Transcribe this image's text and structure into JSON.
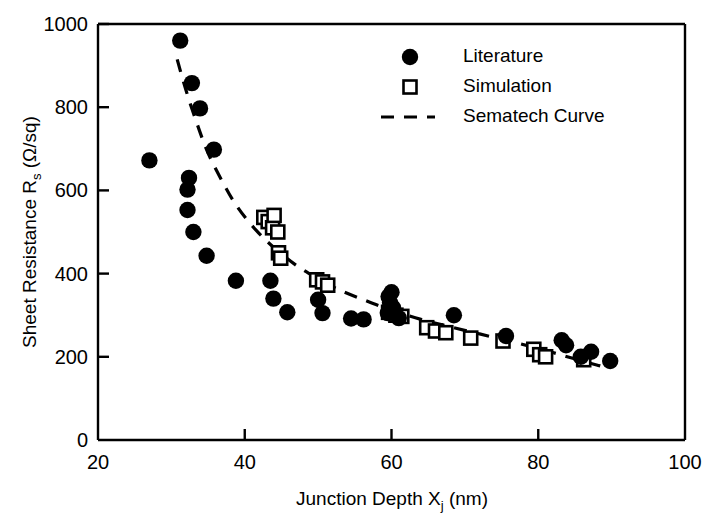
{
  "chart_data": {
    "type": "scatter",
    "title": "",
    "xlabel": "Junction Depth Xj (nm)",
    "xlabel_main": "Junction Depth X",
    "xlabel_sub": "j",
    "xlabel_unit": " (nm)",
    "ylabel": "Sheet Resistance Rs (Ω/sq)",
    "ylabel_main": "Sheet Resistance R",
    "ylabel_sub": "s",
    "ylabel_unit": " (Ω/sq)",
    "xlim": [
      20,
      100
    ],
    "ylim": [
      0,
      1000
    ],
    "xticks": [
      "20",
      "40",
      "60",
      "80",
      "100"
    ],
    "xtick_values": [
      20,
      40,
      60,
      80,
      100
    ],
    "yticks": [
      "0",
      "200",
      "400",
      "600",
      "800",
      "1000"
    ],
    "ytick_values": [
      0,
      200,
      400,
      600,
      800,
      1000
    ],
    "grid": false,
    "legend_position": "top-right-inside",
    "series": [
      {
        "name": "Literature",
        "marker": "filled-circle",
        "color": "#000000",
        "points": [
          [
            27.0,
            672
          ],
          [
            31.2,
            960
          ],
          [
            32.8,
            858
          ],
          [
            33.9,
            797
          ],
          [
            35.8,
            698
          ],
          [
            32.4,
            630
          ],
          [
            32.2,
            602
          ],
          [
            32.2,
            553
          ],
          [
            33.0,
            500
          ],
          [
            34.8,
            443
          ],
          [
            38.8,
            383
          ],
          [
            43.5,
            383
          ],
          [
            43.9,
            340
          ],
          [
            45.8,
            307
          ],
          [
            50.0,
            337
          ],
          [
            50.6,
            305
          ],
          [
            54.5,
            292
          ],
          [
            56.2,
            290
          ],
          [
            59.5,
            305
          ],
          [
            59.6,
            345
          ],
          [
            60.0,
            355
          ],
          [
            60.2,
            318
          ],
          [
            59.8,
            330
          ],
          [
            68.5,
            300
          ],
          [
            75.6,
            250
          ],
          [
            83.2,
            240
          ],
          [
            83.8,
            228
          ],
          [
            85.8,
            200
          ],
          [
            87.2,
            212
          ],
          [
            89.8,
            190
          ],
          [
            61.0,
            293
          ]
        ]
      },
      {
        "name": "Simulation",
        "marker": "open-square",
        "color": "#000000",
        "points": [
          [
            42.6,
            535
          ],
          [
            43.2,
            525
          ],
          [
            43.8,
            510
          ],
          [
            44.5,
            500
          ],
          [
            44.0,
            540
          ],
          [
            44.6,
            450
          ],
          [
            44.9,
            437
          ],
          [
            49.8,
            385
          ],
          [
            50.6,
            380
          ],
          [
            51.3,
            372
          ],
          [
            59.6,
            307
          ],
          [
            60.6,
            300
          ],
          [
            61.4,
            297
          ],
          [
            64.8,
            270
          ],
          [
            66.0,
            262
          ],
          [
            67.4,
            258
          ],
          [
            70.8,
            245
          ],
          [
            75.2,
            238
          ],
          [
            79.4,
            218
          ],
          [
            80.2,
            205
          ],
          [
            81.0,
            200
          ],
          [
            86.2,
            193
          ]
        ]
      }
    ],
    "curve": {
      "name": "Sematech Curve",
      "style": "dashed",
      "color": "#000000",
      "points": [
        [
          30.8,
          915
        ],
        [
          32.0,
          840
        ],
        [
          33.5,
          760
        ],
        [
          35.0,
          690
        ],
        [
          37.0,
          620
        ],
        [
          39.0,
          560
        ],
        [
          41.5,
          505
        ],
        [
          44.0,
          462
        ],
        [
          47.0,
          420
        ],
        [
          50.0,
          388
        ],
        [
          53.0,
          360
        ],
        [
          56.5,
          335
        ],
        [
          60.0,
          312
        ],
        [
          64.0,
          290
        ],
        [
          68.0,
          272
        ],
        [
          72.0,
          255
        ],
        [
          76.0,
          238
        ],
        [
          80.0,
          220
        ],
        [
          83.0,
          205
        ],
        [
          86.0,
          190
        ],
        [
          88.5,
          178
        ]
      ]
    },
    "legend": [
      {
        "label": "Literature",
        "marker": "filled-circle"
      },
      {
        "label": "Simulation",
        "marker": "open-square"
      },
      {
        "label": "Sematech Curve",
        "marker": "dashed-line"
      }
    ]
  }
}
